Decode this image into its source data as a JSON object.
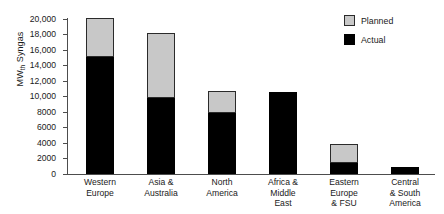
{
  "chart_data": {
    "type": "bar",
    "subtype": "stacked-vertical",
    "title": "",
    "xlabel": "",
    "ylabel": "MW th Syngas",
    "ylabel_main": "MW",
    "ylabel_subscript": "th",
    "ylabel_suffix": " Syngas",
    "ylim": [
      0,
      20000
    ],
    "ytick_step": 2000,
    "grid": false,
    "categories": [
      "Western Europe",
      "Asia & Australia",
      "North America",
      "Africa & Middle East",
      "Eastern Europe & FSU",
      "Central & South America"
    ],
    "category_lines": [
      [
        "Western",
        "Europe"
      ],
      [
        "Asia &",
        "Australia"
      ],
      [
        "North",
        "America"
      ],
      [
        "Africa &",
        "Middle",
        "East"
      ],
      [
        "Eastern",
        "Europe",
        "& FSU"
      ],
      [
        "Central",
        "& South",
        "America"
      ]
    ],
    "ytick_labels": [
      "20,000",
      "18,000",
      "16,000",
      "14,000",
      "12,000",
      "10,000",
      "8000",
      "6000",
      "4000",
      "2000",
      "0"
    ],
    "ytick_values": [
      20000,
      18000,
      16000,
      14000,
      12000,
      10000,
      8000,
      6000,
      4000,
      2000,
      0
    ],
    "series": [
      {
        "name": "Actual",
        "color": "#000000",
        "values": [
          15000,
          9800,
          7900,
          10600,
          1400,
          900
        ]
      },
      {
        "name": "Planned",
        "color": "#c8c8c8",
        "values": [
          5000,
          8200,
          2600,
          0,
          2300,
          0
        ]
      }
    ],
    "totals": [
      20000,
      18000,
      10500,
      10600,
      3700,
      900
    ],
    "legend_position": "top-right",
    "legend": [
      {
        "label": "Planned",
        "color": "#c8c8c8"
      },
      {
        "label": "Actual",
        "color": "#000000"
      }
    ]
  },
  "colors": {
    "planned": "#c8c8c8",
    "actual": "#000000",
    "axis": "#4d4d4d",
    "text": "#1a1a1a",
    "background": "#ffffff"
  }
}
